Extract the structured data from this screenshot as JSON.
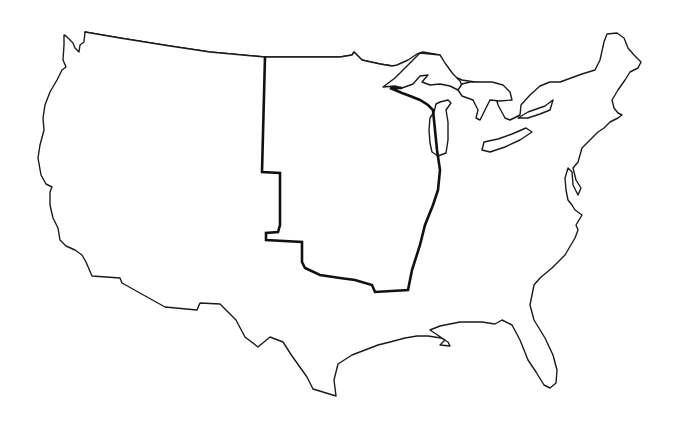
{
  "map": {
    "type": "outline-map",
    "subject": "Contiguous United States outline",
    "background_color": "#ffffff",
    "outline_color": "#1a1a1a",
    "highlight_border_color": "#111111",
    "features": [
      {
        "id": "us-outline",
        "label": "United States outline"
      },
      {
        "id": "great-lakes",
        "label": "Great Lakes"
      },
      {
        "id": "highlighted-region",
        "label": "Thick-bordered central region"
      }
    ],
    "labels": []
  }
}
